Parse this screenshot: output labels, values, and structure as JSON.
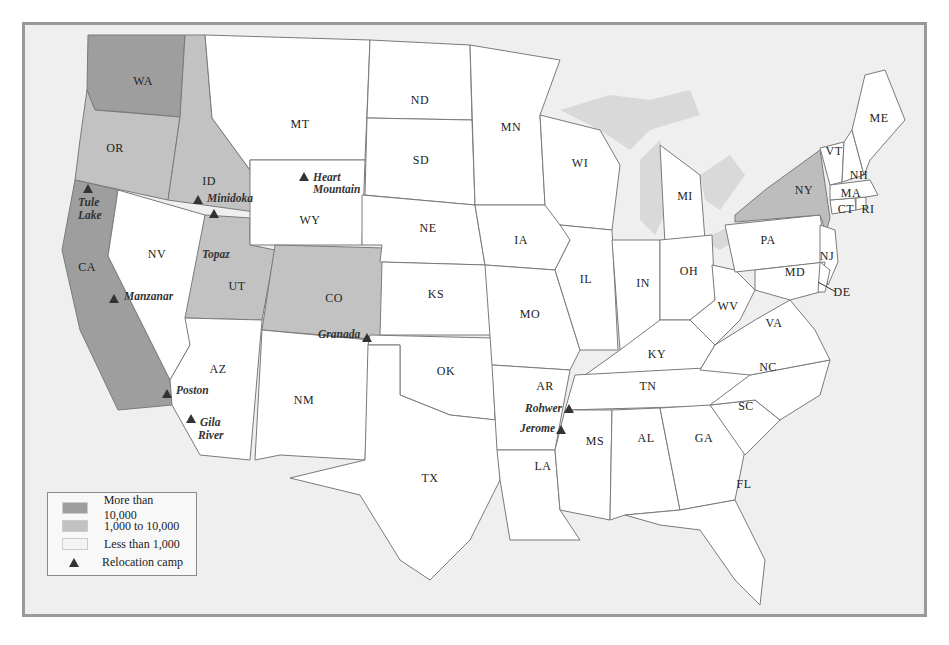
{
  "legend": {
    "items": [
      {
        "label": "More than 10,000",
        "color": "#9a9a9a"
      },
      {
        "label": "1,000 to 10,000",
        "color": "#bdbdbd"
      },
      {
        "label": "Less than 1,000",
        "color": "#ffffff"
      },
      {
        "label": "Relocation camp",
        "symbol": "triangle"
      }
    ]
  },
  "colors": {
    "high": "#9e9e9e",
    "mid": "#c2c2c2",
    "low": "#ffffff",
    "water": "#d9d9d9",
    "background": "#efefef"
  },
  "states": {
    "WA": "WA",
    "OR": "OR",
    "CA": "CA",
    "ID": "ID",
    "NV": "NV",
    "UT": "UT",
    "AZ": "AZ",
    "MT": "MT",
    "WY": "WY",
    "CO": "CO",
    "NM": "NM",
    "ND": "ND",
    "SD": "SD",
    "NE": "NE",
    "KS": "KS",
    "OK": "OK",
    "TX": "TX",
    "MN": "MN",
    "IA": "IA",
    "MO": "MO",
    "AR": "AR",
    "LA": "LA",
    "WI": "WI",
    "IL": "IL",
    "MI": "MI",
    "IN": "IN",
    "OH": "OH",
    "KY": "KY",
    "TN": "TN",
    "MS": "MS",
    "AL": "AL",
    "GA": "GA",
    "FL": "FL",
    "SC": "SC",
    "NC": "NC",
    "VA": "VA",
    "WV": "WV",
    "PA": "PA",
    "NY": "NY",
    "NJ": "NJ",
    "DE": "DE",
    "MD": "MD",
    "CT": "CT",
    "RI": "RI",
    "MA": "MA",
    "VT": "VT",
    "NH": "NH",
    "ME": "ME"
  },
  "camps": {
    "tule1": "Tule",
    "tule2": "Lake",
    "minidoka": "Minidoka",
    "heart1": "Heart",
    "heart2": "Mountain",
    "topaz": "Topaz",
    "manzanar": "Manzanar",
    "granada": "Granada",
    "poston": "Poston",
    "gila1": "Gila",
    "gila2": "River",
    "rohwer": "Rohwer",
    "jerome": "Jerome"
  }
}
